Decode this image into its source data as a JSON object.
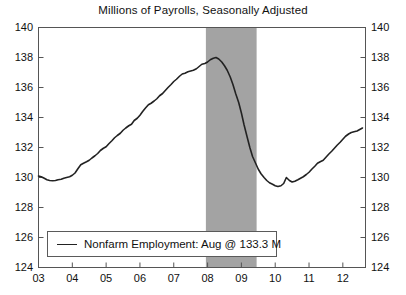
{
  "chart_data": {
    "type": "line",
    "title": "Millions of Payrolls, Seasonally Adjusted",
    "xlabel": "",
    "ylabel": "",
    "ylim": [
      124,
      140
    ],
    "xlim": [
      2003.0,
      2012.67
    ],
    "y_ticks": [
      "124",
      "126",
      "128",
      "130",
      "132",
      "134",
      "136",
      "138",
      "140"
    ],
    "y_tick_values": [
      124,
      126,
      128,
      130,
      132,
      134,
      136,
      138,
      140
    ],
    "x_ticks": [
      "03",
      "04",
      "05",
      "06",
      "07",
      "08",
      "09",
      "10",
      "11",
      "12"
    ],
    "x_tick_values": [
      2003,
      2004,
      2005,
      2006,
      2007,
      2008,
      2009,
      2010,
      2011,
      2012
    ],
    "grid": false,
    "legend_position": "bottom-left",
    "line_color": "#222222",
    "shaded_band_color": "#a3a3a3",
    "axis_color": "#555555",
    "series": [
      {
        "name": "Nonfarm Employment",
        "legend_label": "Nonfarm Employment: Aug @ 133.3 M",
        "latest_value": 133.3,
        "latest_period": "Aug",
        "units": "M",
        "x": [
          2003.0,
          2003.08,
          2003.17,
          2003.25,
          2003.33,
          2003.42,
          2003.5,
          2003.58,
          2003.67,
          2003.75,
          2003.83,
          2003.92,
          2004.0,
          2004.08,
          2004.17,
          2004.25,
          2004.33,
          2004.42,
          2004.5,
          2004.58,
          2004.67,
          2004.75,
          2004.83,
          2004.92,
          2005.0,
          2005.08,
          2005.17,
          2005.25,
          2005.33,
          2005.42,
          2005.5,
          2005.58,
          2005.67,
          2005.75,
          2005.83,
          2005.92,
          2006.0,
          2006.08,
          2006.17,
          2006.25,
          2006.33,
          2006.42,
          2006.5,
          2006.58,
          2006.67,
          2006.75,
          2006.83,
          2006.92,
          2007.0,
          2007.08,
          2007.17,
          2007.25,
          2007.33,
          2007.42,
          2007.5,
          2007.58,
          2007.67,
          2007.75,
          2007.83,
          2007.92,
          2008.0,
          2008.08,
          2008.17,
          2008.25,
          2008.33,
          2008.42,
          2008.5,
          2008.58,
          2008.67,
          2008.75,
          2008.83,
          2008.92,
          2009.0,
          2009.08,
          2009.17,
          2009.25,
          2009.33,
          2009.42,
          2009.5,
          2009.58,
          2009.67,
          2009.75,
          2009.83,
          2009.92,
          2010.0,
          2010.08,
          2010.17,
          2010.25,
          2010.33,
          2010.42,
          2010.5,
          2010.58,
          2010.67,
          2010.75,
          2010.83,
          2010.92,
          2011.0,
          2011.08,
          2011.17,
          2011.25,
          2011.33,
          2011.42,
          2011.5,
          2011.58,
          2011.67,
          2011.75,
          2011.83,
          2011.92,
          2012.0,
          2012.08,
          2012.17,
          2012.25,
          2012.33,
          2012.42,
          2012.5,
          2012.58
        ],
        "values": [
          130.1,
          130.05,
          129.95,
          129.85,
          129.8,
          129.78,
          129.8,
          129.85,
          129.88,
          129.95,
          130.0,
          130.05,
          130.15,
          130.3,
          130.6,
          130.85,
          130.95,
          131.05,
          131.15,
          131.3,
          131.45,
          131.6,
          131.8,
          131.95,
          132.05,
          132.25,
          132.45,
          132.65,
          132.8,
          132.95,
          133.15,
          133.3,
          133.45,
          133.55,
          133.8,
          133.95,
          134.15,
          134.4,
          134.65,
          134.85,
          134.95,
          135.1,
          135.25,
          135.45,
          135.6,
          135.8,
          136.0,
          136.2,
          136.4,
          136.55,
          136.75,
          136.9,
          136.95,
          137.05,
          137.1,
          137.15,
          137.25,
          137.4,
          137.55,
          137.6,
          137.7,
          137.85,
          137.95,
          138.0,
          137.9,
          137.7,
          137.45,
          137.15,
          136.7,
          136.2,
          135.6,
          135.0,
          134.3,
          133.5,
          132.7,
          132.0,
          131.4,
          130.95,
          130.55,
          130.25,
          130.0,
          129.8,
          129.65,
          129.55,
          129.45,
          129.4,
          129.45,
          129.6,
          130.0,
          129.8,
          129.7,
          129.75,
          129.85,
          129.95,
          130.05,
          130.2,
          130.35,
          130.55,
          130.75,
          130.95,
          131.05,
          131.15,
          131.35,
          131.55,
          131.75,
          131.95,
          132.15,
          132.35,
          132.55,
          132.75,
          132.9,
          133.0,
          133.05,
          133.1,
          133.2,
          133.3
        ]
      }
    ],
    "shaded_regions": [
      {
        "label": "recession",
        "x_start": 2007.95,
        "x_end": 2009.45
      }
    ]
  }
}
